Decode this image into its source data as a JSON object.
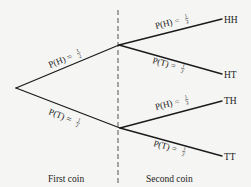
{
  "diagram": {
    "type": "probability-tree",
    "stages": {
      "first": "First coin",
      "second": "Second coin"
    },
    "branches": {
      "root_to_H": {
        "prob_label": "P(H) = ",
        "num": "1",
        "den": "2"
      },
      "root_to_T": {
        "prob_label": "P(T) = ",
        "num": "1",
        "den": "2"
      },
      "H_to_HH": {
        "prob_label": "P(H) = ",
        "num": "1",
        "den": "2"
      },
      "H_to_HT": {
        "prob_label": "P(T) = ",
        "num": "1",
        "den": "2"
      },
      "T_to_TH": {
        "prob_label": "P(H) = ",
        "num": "1",
        "den": "2"
      },
      "T_to_TT": {
        "prob_label": "P(T) = ",
        "num": "1",
        "den": "2"
      }
    },
    "outcomes": {
      "HH": "HH",
      "HT": "HT",
      "TH": "TH",
      "TT": "TT"
    },
    "colors": {
      "line": "#1a1a1a",
      "background": "#f5f5f3"
    }
  }
}
